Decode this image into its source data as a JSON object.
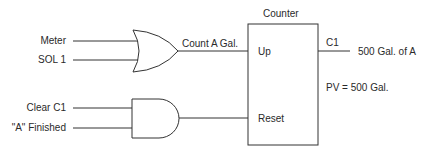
{
  "diagram": {
    "type": "ladder-logic counter with OR and AND gates",
    "or_gate": {
      "inputs": [
        "Meter",
        "SOL 1"
      ],
      "output_label": "Count A Gal."
    },
    "and_gate": {
      "inputs": [
        "Clear C1",
        "\"A\" Finished"
      ]
    },
    "counter": {
      "title": "Counter",
      "up_label": "Up",
      "reset_label": "Reset",
      "output_tag": "C1",
      "output_label": "500 Gal. of A",
      "preset": "PV = 500 Gal."
    },
    "line_color": "#333333"
  }
}
